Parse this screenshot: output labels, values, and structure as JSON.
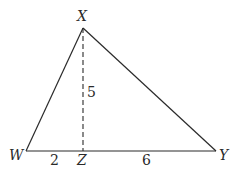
{
  "diagram": {
    "type": "triangle-with-altitude",
    "vertices": {
      "X": {
        "label": "X",
        "x": 83,
        "y": 28
      },
      "W": {
        "label": "W",
        "x": 26,
        "y": 151
      },
      "Y": {
        "label": "Y",
        "x": 216,
        "y": 151
      },
      "Z": {
        "label": "Z",
        "x": 83,
        "y": 151
      }
    },
    "segments": [
      {
        "from": "W",
        "to": "X",
        "style": "solid"
      },
      {
        "from": "X",
        "to": "Y",
        "style": "solid"
      },
      {
        "from": "W",
        "to": "Y",
        "style": "solid"
      },
      {
        "from": "X",
        "to": "Z",
        "style": "dashed"
      }
    ],
    "measures": {
      "WZ": "2",
      "ZY": "6",
      "XZ": "5"
    },
    "stroke_color": "#2a2a2a"
  }
}
